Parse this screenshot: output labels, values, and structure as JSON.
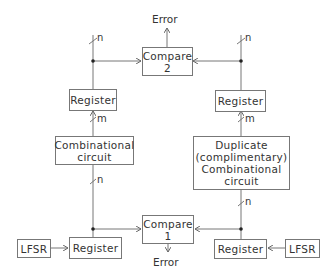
{
  "diagram": {
    "compare2": {
      "line1": "Compare",
      "line2": "2"
    },
    "compare1": {
      "line1": "Compare",
      "line2": "1"
    },
    "error_top": "Error",
    "error_bottom": "Error",
    "register_top_left": "Register",
    "register_top_right": "Register",
    "register_bottom_left": "Register",
    "register_bottom_right": "Register",
    "comb_left": {
      "line1": "Combinational",
      "line2": "circuit"
    },
    "comb_right": {
      "line1": "Duplicate",
      "line2": "(complimentary)",
      "line3": "Combinational",
      "line4": "circuit"
    },
    "lfsr_left": "LFSR",
    "lfsr_right": "LFSR",
    "bus_labels": {
      "top_left": "n",
      "top_right": "n",
      "mid_left": "m",
      "mid_right": "m",
      "bottom_left": "n",
      "bottom_right": "n"
    },
    "line_color": "#777777"
  }
}
